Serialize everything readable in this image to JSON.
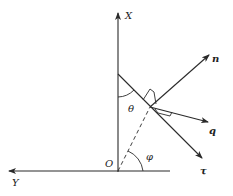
{
  "diagram": {
    "type": "vector-geometry",
    "axes": {
      "x_axis_label": "X",
      "y_axis_label": "Y",
      "origin_label": "O"
    },
    "vectors": [
      {
        "id": "n",
        "label": "n",
        "style": "bold"
      },
      {
        "id": "q",
        "label": "q",
        "style": "bold"
      },
      {
        "id": "tau",
        "label": "τ",
        "style": "bold"
      }
    ],
    "angles": [
      {
        "id": "theta",
        "label": "θ"
      },
      {
        "id": "phi",
        "label": "φ"
      }
    ],
    "colors": {
      "line": "#2a2a2a",
      "background": "#ffffff"
    }
  }
}
